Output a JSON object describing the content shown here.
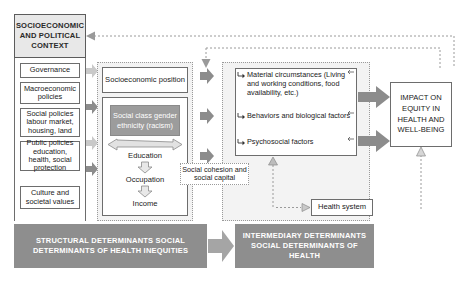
{
  "diagram": {
    "title_context": "SOCIOECONOMIC AND POLITICAL CONTEXT",
    "context_items": [
      "Governance",
      "Macroeconomic policies",
      "Social policies labour market, housing, land",
      "Public policies education, health, social protection",
      "Culture and societal values"
    ],
    "structural": {
      "position_label": "Socioeconomic position",
      "social_class_box": "Social class gender ethnicity (racism)",
      "chain": [
        "Education",
        "Occupation",
        "Income"
      ]
    },
    "intermediary": {
      "bullets": [
        "Material circumstances (Living and working conditions, food availability, etc.)",
        "Behaviors and biological factors",
        "Psychosocial factors"
      ],
      "cohesion_label": "Social cohesion and social capital",
      "health_system_label": "Health system"
    },
    "impact_label": "IMPACT ON EQUITY IN HEALTH AND WELL-BEING",
    "banners": {
      "left": "STRUCTURAL DETERMINANTS SOCIAL DETERMINANTS OF HEALTH INEQUITIES",
      "right": "INTERMEDIARY DETERMINANTS SOCIAL DETERMINANTS OF HEALTH"
    },
    "colors": {
      "gray_fill": "#9c9c9c",
      "banner_gray": "#8e8e8e",
      "arrow_gray": "#8c8c8c",
      "arrow_gray_light": "#c4c4c4",
      "header_fill": "#e8e8e8",
      "panel_fill": "#f3f3f3",
      "line": "#6d6d6d"
    }
  }
}
